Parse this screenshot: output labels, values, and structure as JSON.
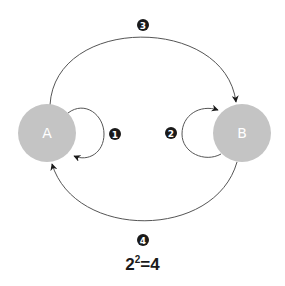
{
  "diagram": {
    "nodes": [
      {
        "id": "A",
        "label": "A",
        "cx": 47,
        "cy": 133,
        "r": 29,
        "fill": "#c4c4c4"
      },
      {
        "id": "B",
        "label": "B",
        "cx": 242,
        "cy": 133,
        "r": 29,
        "fill": "#c4c4c4"
      }
    ],
    "edges": [
      {
        "id": "1",
        "from": "A",
        "to": "A",
        "badge": "1",
        "type": "self-loop"
      },
      {
        "id": "2",
        "from": "B",
        "to": "B",
        "badge": "2",
        "type": "self-loop"
      },
      {
        "id": "3",
        "from": "A",
        "to": "B",
        "badge": "3",
        "type": "upper-arc"
      },
      {
        "id": "4",
        "from": "B",
        "to": "A",
        "badge": "4",
        "type": "lower-arc"
      }
    ],
    "badges": {
      "b1": "1",
      "b2": "2",
      "b3": "3",
      "b4": "4"
    },
    "formula": {
      "base": "2",
      "exponent": "2",
      "equals": "=",
      "result": "4"
    },
    "colors": {
      "node_fill": "#c4c4c4",
      "edge_stroke": "#555555",
      "badge_fill": "#1a1a1a"
    }
  }
}
